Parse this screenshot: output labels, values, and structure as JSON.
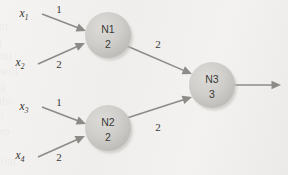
{
  "figure": {
    "type": "neural-network-diagram",
    "background_color": "#f1f0ee",
    "node_fill_color": "#cfcecb",
    "edge_color": "#8d8b88",
    "text_color": "#33332f"
  },
  "inputs": [
    {
      "id": "x1",
      "name": "x",
      "subscript": "1",
      "x": 24,
      "y": 17
    },
    {
      "id": "x2",
      "name": "x",
      "subscript": "2",
      "x": 20,
      "y": 66
    },
    {
      "id": "x3",
      "name": "x",
      "subscript": "3",
      "x": 24,
      "y": 110
    },
    {
      "id": "x4",
      "name": "x",
      "subscript": "4",
      "x": 20,
      "y": 159
    }
  ],
  "nodes": [
    {
      "id": "N1",
      "label": "N1",
      "threshold": "2",
      "cx": 108,
      "cy": 35,
      "r": 23
    },
    {
      "id": "N2",
      "label": "N2",
      "threshold": "2",
      "cx": 108,
      "cy": 128,
      "r": 23
    },
    {
      "id": "N3",
      "label": "N3",
      "threshold": "3",
      "cx": 212,
      "cy": 85,
      "r": 23
    }
  ],
  "edges": [
    {
      "id": "x1-n1",
      "from": "x1",
      "to": "N1",
      "weight": "1",
      "x1": 42,
      "y1": 14,
      "x2": 86,
      "y2": 31,
      "label_x": 59,
      "label_y": 13
    },
    {
      "id": "x2-n1",
      "from": "x2",
      "to": "N1",
      "weight": "2",
      "x1": 38,
      "y1": 64,
      "x2": 85,
      "y2": 43,
      "label_x": 59,
      "label_y": 68
    },
    {
      "id": "x3-n2",
      "from": "x3",
      "to": "N2",
      "weight": "1",
      "x1": 42,
      "y1": 107,
      "x2": 86,
      "y2": 124,
      "label_x": 59,
      "label_y": 106
    },
    {
      "id": "x4-n2",
      "from": "x4",
      "to": "N2",
      "weight": "2",
      "x1": 38,
      "y1": 157,
      "x2": 85,
      "y2": 136,
      "label_x": 59,
      "label_y": 161
    },
    {
      "id": "n1-n3",
      "from": "N1",
      "to": "N3",
      "weight": "2",
      "x1": 127,
      "y1": 46,
      "x2": 192,
      "y2": 74,
      "label_x": 158,
      "label_y": 48
    },
    {
      "id": "n2-n3",
      "from": "N2",
      "to": "N3",
      "weight": "2",
      "x1": 127,
      "y1": 118,
      "x2": 192,
      "y2": 97,
      "label_x": 158,
      "label_y": 131
    }
  ],
  "output_edge": {
    "id": "n3-output",
    "from": "N3",
    "x1": 235,
    "y1": 85,
    "x2": 281,
    "y2": 85
  },
  "ghost_text": {
    "lines": [
      {
        "text": "nod to esm 101 to ntoitsilqqs",
        "x": 0,
        "y": 4
      },
      {
        "text": "tqooxo (MDV) rol oon ti woled vj",
        "x": 8,
        "y": 19
      },
      {
        "text": "gniniq ot boriupor tud inolig nut",
        "x": 2,
        "y": 34
      },
      {
        "text": "tsrit bnts gnitts ni gniqmuj uoy",
        "x": 12,
        "y": 49
      },
      {
        "text": "lliw oril gniniw gniwollol uoy",
        "x": 18,
        "y": 64
      },
      {
        "text": "gnihton si eidi tud ,snoitqo",
        "x": 6,
        "y": 79
      },
      {
        "text": "odt no rovo si oronw oni",
        "x": 14,
        "y": 94
      },
      {
        "text": "odt bluow ti ,rotol od tsum ti tud",
        "x": 4,
        "y": 109
      },
      {
        "text": "ewod tngit ,rodtons ni drow",
        "x": 10,
        "y": 124
      },
      {
        "text": "yrovo romit ni tgionw oril rodtio",
        "x": 0,
        "y": 139
      },
      {
        "text": "moni nwodz won ni sniqmoo",
        "x": 16,
        "y": 154
      }
    ]
  }
}
